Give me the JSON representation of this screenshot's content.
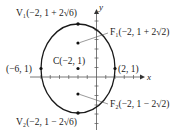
{
  "diagram": {
    "type": "ellipse-graph",
    "axes": {
      "x_label": "x",
      "y_label": "y"
    },
    "ellipse": {
      "center": [
        -2,
        1
      ],
      "a_vertical": "2√6",
      "b_horizontal": 4
    },
    "labels": {
      "v1": "V₁(−2, 1 + 2√6)",
      "v2": "V₂(−2, 1 − 2√6)",
      "f1": "F₁(−2, 1 + 2√2)",
      "f2": "F₂(−2, 1 − 2√2)",
      "center": "C(−2, 1)",
      "left_point": "(−6, 1)",
      "right_point": "(2, 1)"
    },
    "colors": {
      "stroke": "#1a1a1a",
      "axis": "#555555"
    }
  }
}
